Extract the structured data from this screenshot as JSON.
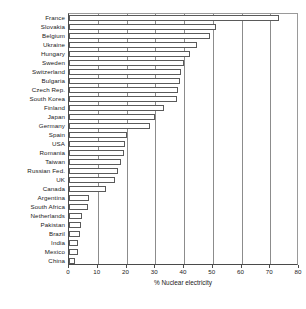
{
  "chart_data": {
    "type": "bar",
    "orientation": "horizontal",
    "title": "",
    "xlabel": "% Nuclear electricity",
    "ylabel": "",
    "xlim": [
      0,
      80
    ],
    "xticks": [
      0,
      10,
      20,
      30,
      40,
      50,
      60,
      70,
      80
    ],
    "xtick_labels": [
      "0",
      "10",
      "20",
      "30",
      "40",
      "50",
      "60",
      "70",
      "80"
    ],
    "grid": true,
    "grid_axis": "x",
    "legend": "none",
    "bar_face_color": "#ffffff",
    "bar_edge_color": "#5a5a5a",
    "axis_color": "#4a4a4a",
    "categories": [
      "France",
      "Slovakia",
      "Belgium",
      "Ukraine",
      "Hungary",
      "Sweden",
      "Switzerland",
      "Bulgaria",
      "Czech Rep.",
      "South Korea",
      "Finland",
      "Japan",
      "Germany",
      "Spain",
      "USA",
      "Romania",
      "Taiwan",
      "Russian Fed.",
      "UK",
      "Canada",
      "Argentina",
      "South Africa",
      "Netherlands",
      "Pakistan",
      "Brazil",
      "India",
      "Mexico",
      "China"
    ],
    "values": [
      73.0,
      51.0,
      49.0,
      44.5,
      42.0,
      40.0,
      39.0,
      38.5,
      38.0,
      37.5,
      33.0,
      30.0,
      28.0,
      20.0,
      19.5,
      19.0,
      18.0,
      17.0,
      16.0,
      13.0,
      7.0,
      6.5,
      4.5,
      4.0,
      3.8,
      3.2,
      3.0,
      2.2
    ]
  },
  "footer": {
    "ghost_text": ""
  }
}
